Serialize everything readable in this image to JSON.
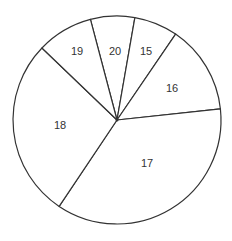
{
  "chart_data": {
    "type": "pie",
    "title": "",
    "categories": [
      "20",
      "15",
      "16",
      "17",
      "18",
      "19"
    ],
    "values": [
      6.9,
      6.8,
      13.8,
      36.1,
      27.8,
      8.7
    ],
    "units": "percent of circle (estimated from slice angles)",
    "slices": [
      {
        "label": "20",
        "start_deg": -104.8,
        "end_deg": -80.1,
        "label_x": 115,
        "label_y": 52
      },
      {
        "label": "15",
        "start_deg": -80.1,
        "end_deg": -55.7,
        "label_x": 146,
        "label_y": 52
      },
      {
        "label": "16",
        "start_deg": -55.7,
        "end_deg": -6.1,
        "label_x": 172,
        "label_y": 89
      },
      {
        "label": "17",
        "start_deg": -6.1,
        "end_deg": 123.8,
        "label_x": 147,
        "label_y": 164
      },
      {
        "label": "18",
        "start_deg": 123.8,
        "end_deg": 223.8,
        "label_x": 60,
        "label_y": 126
      },
      {
        "label": "19",
        "start_deg": 223.8,
        "end_deg": 255.2,
        "label_x": 77,
        "label_y": 52
      }
    ],
    "legend": null,
    "colors": {
      "fill": "#ffffff",
      "stroke": "#333333",
      "text": "#333333"
    }
  },
  "geometry": {
    "cx": 117,
    "cy": 120,
    "r": 104
  }
}
